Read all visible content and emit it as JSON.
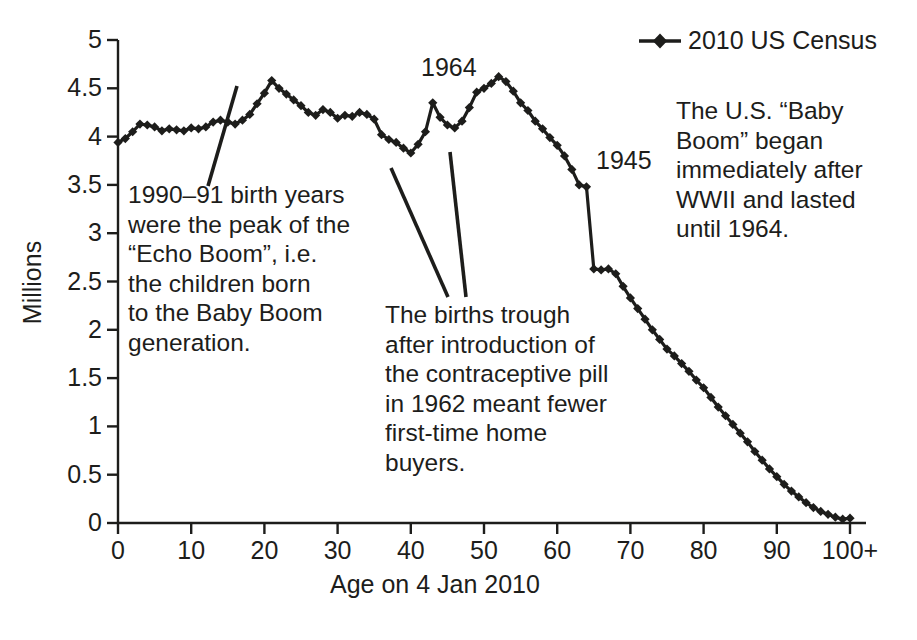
{
  "chart_data": {
    "type": "line",
    "title": "",
    "subtitle": "",
    "xlabel": "Age on 4 Jan 2010",
    "ylabel": "Millions",
    "xlim": [
      0,
      100
    ],
    "ylim": [
      0,
      5
    ],
    "grid": false,
    "legend_position": "top-right",
    "series": [
      {
        "name": "2010 US Census",
        "marker": "diamond",
        "color": "#1d1d1b",
        "x": [
          0,
          1,
          2,
          3,
          4,
          5,
          6,
          7,
          8,
          9,
          10,
          11,
          12,
          13,
          14,
          15,
          16,
          17,
          18,
          19,
          20,
          21,
          22,
          23,
          24,
          25,
          26,
          27,
          28,
          29,
          30,
          31,
          32,
          33,
          34,
          35,
          36,
          37,
          38,
          39,
          40,
          41,
          42,
          43,
          44,
          45,
          46,
          47,
          48,
          49,
          50,
          51,
          52,
          53,
          54,
          55,
          56,
          57,
          58,
          59,
          60,
          61,
          62,
          63,
          64,
          65,
          66,
          67,
          68,
          69,
          70,
          71,
          72,
          73,
          74,
          75,
          76,
          77,
          78,
          79,
          80,
          81,
          82,
          83,
          84,
          85,
          86,
          87,
          88,
          89,
          90,
          91,
          92,
          93,
          94,
          95,
          96,
          97,
          98,
          99,
          100
        ],
        "y": [
          3.94,
          3.98,
          4.05,
          4.13,
          4.12,
          4.1,
          4.06,
          4.08,
          4.07,
          4.06,
          4.09,
          4.08,
          4.1,
          4.15,
          4.17,
          4.15,
          4.13,
          4.17,
          4.23,
          4.34,
          4.45,
          4.58,
          4.5,
          4.44,
          4.38,
          4.32,
          4.25,
          4.22,
          4.28,
          4.25,
          4.19,
          4.22,
          4.21,
          4.25,
          4.23,
          4.18,
          4.02,
          3.97,
          3.94,
          3.88,
          3.83,
          3.92,
          4.05,
          4.35,
          4.2,
          4.12,
          4.09,
          4.16,
          4.3,
          4.46,
          4.5,
          4.55,
          4.62,
          4.57,
          4.47,
          4.35,
          4.27,
          4.16,
          4.08,
          3.99,
          3.91,
          3.8,
          3.66,
          3.5,
          3.48,
          2.63,
          2.62,
          2.63,
          2.58,
          2.45,
          2.33,
          2.22,
          2.11,
          2.0,
          1.9,
          1.8,
          1.73,
          1.65,
          1.57,
          1.48,
          1.4,
          1.3,
          1.2,
          1.11,
          1.02,
          0.93,
          0.84,
          0.74,
          0.65,
          0.56,
          0.48,
          0.4,
          0.33,
          0.27,
          0.21,
          0.16,
          0.12,
          0.09,
          0.06,
          0.04,
          0.05
        ]
      }
    ],
    "x_ticks": [
      "0",
      "10",
      "20",
      "30",
      "40",
      "50",
      "60",
      "70",
      "80",
      "90",
      "100+"
    ],
    "x_tick_values": [
      0,
      10,
      20,
      30,
      40,
      50,
      60,
      70,
      80,
      90,
      100
    ],
    "y_ticks": [
      "0",
      "0.5",
      "1",
      "1.5",
      "2",
      "2.5",
      "3",
      "3.5",
      "4",
      "4.5",
      "5"
    ],
    "y_tick_values": [
      0,
      0.5,
      1,
      1.5,
      2,
      2.5,
      3,
      3.5,
      4,
      4.5,
      5
    ],
    "annotations": [
      {
        "id": "echo-boom",
        "text": "1990–91 birth years\nwere the peak of the\n“Echo Boom”, i.e.\nthe children born\nto the Baby Boom\ngeneration.",
        "points_to_age": 20
      },
      {
        "id": "pill-trough",
        "text": "The births trough\nafter introduction of\nthe contraceptive pill\nin 1962 meant fewer\nfirst-time home\nbuyers.",
        "points_to_age": [
          37,
          44
        ]
      },
      {
        "id": "baby-boom",
        "text": "The U.S. “Baby\nBoom” began\nimmediately after\nWWII and lasted\nuntil 1964.",
        "points_to_age": null
      }
    ],
    "point_labels": [
      {
        "id": "label-1964",
        "text": "1964",
        "age": 46
      },
      {
        "id": "label-1945",
        "text": "1945",
        "age": 64
      }
    ],
    "colors": {
      "line": "#1d1d1b",
      "marker": "#1d1d1b",
      "axis": "#1d1d1b",
      "text": "#1d1d1b",
      "background": "#ffffff"
    }
  }
}
